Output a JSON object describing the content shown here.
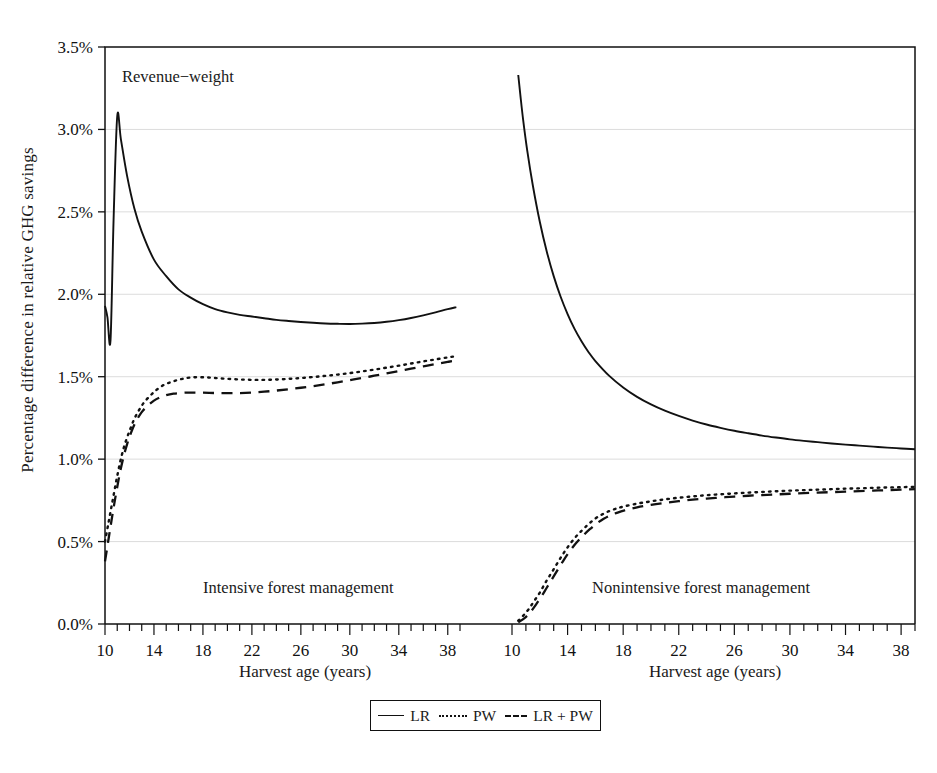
{
  "figure": {
    "ylabel": "Percentage difference in relative GHG savings",
    "annotation_top": "Revenue−weight",
    "panel_left_label": "Intensive forest management",
    "panel_right_label": "Nonintensive forest management",
    "xlabel_left": "Harvest age (years)",
    "xlabel_right": "Harvest age (years)",
    "line_color": "#111111",
    "grid_color": "#d8d8d8",
    "frame_color": "#111111"
  },
  "legend": {
    "position": "bottom-center",
    "items": [
      {
        "label": "LR",
        "style": "solid",
        "icon": "solid-line-swatch"
      },
      {
        "label": "PW",
        "style": "dotted",
        "icon": "dotted-line-swatch"
      },
      {
        "label": "LR + PW",
        "style": "dashed",
        "icon": "dashed-line-swatch"
      }
    ]
  },
  "chart_data": {
    "type": "line",
    "title": "Revenue−weight",
    "ylabel": "Percentage difference in relative GHG savings",
    "xlabel": "Harvest age (years)",
    "ylim": [
      0.0,
      3.5
    ],
    "yticks": [
      0.0,
      0.5,
      1.0,
      1.5,
      2.0,
      2.5,
      3.0,
      3.5
    ],
    "ytick_labels": [
      "0.0%",
      "0.5%",
      "1.0%",
      "1.5%",
      "2.0%",
      "2.5%",
      "3.0%",
      "3.5%"
    ],
    "grid": "horizontal",
    "xlim": [
      10,
      39
    ],
    "xticks": [
      10,
      11,
      12,
      13,
      14,
      15,
      16,
      17,
      18,
      19,
      20,
      21,
      22,
      23,
      24,
      25,
      26,
      27,
      28,
      29,
      30,
      31,
      32,
      33,
      34,
      35,
      36,
      37,
      38,
      39
    ],
    "xtick_labels": [
      10,
      14,
      18,
      22,
      26,
      30,
      34,
      38
    ],
    "panels": [
      {
        "name": "Intensive forest management",
        "series": [
          {
            "name": "LR",
            "style": "solid",
            "x": [
              10.0,
              10.2,
              10.45,
              10.7,
              11.0,
              11.3,
              11.8,
              12.4,
              13.0,
              14.0,
              15.0,
              16.0,
              17.0,
              18.0,
              19.0,
              20.0,
              21.0,
              22.0,
              23.0,
              24.0,
              25.0,
              26.0,
              27.0,
              28.0,
              29.0,
              30.0,
              31.0,
              32.0,
              33.0,
              34.0,
              35.0,
              36.0,
              37.0,
              38.0,
              38.7
            ],
            "y": [
              1.93,
              1.86,
              1.72,
              2.45,
              3.08,
              2.94,
              2.72,
              2.52,
              2.38,
              2.21,
              2.11,
              2.03,
              1.98,
              1.94,
              1.91,
              1.89,
              1.875,
              1.865,
              1.855,
              1.845,
              1.838,
              1.832,
              1.827,
              1.823,
              1.821,
              1.82,
              1.822,
              1.826,
              1.833,
              1.843,
              1.856,
              1.872,
              1.89,
              1.91,
              1.922
            ]
          },
          {
            "name": "PW",
            "style": "dotted",
            "x": [
              10.0,
              10.3,
              10.6,
              10.9,
              11.2,
              11.5,
              11.8,
              12.1,
              12.4,
              12.8,
              13.2,
              13.7,
              14.2,
              14.8,
              15.5,
              16.2,
              17.0,
              18.0,
              19.0,
              20.0,
              21.0,
              22.0,
              23.0,
              24.0,
              25.0,
              26.0,
              27.0,
              28.0,
              29.0,
              30.0,
              31.0,
              32.0,
              33.0,
              34.0,
              35.0,
              36.0,
              37.0,
              38.0,
              38.7
            ],
            "y": [
              0.5,
              0.62,
              0.74,
              0.86,
              0.97,
              1.06,
              1.13,
              1.19,
              1.245,
              1.3,
              1.345,
              1.385,
              1.42,
              1.45,
              1.47,
              1.485,
              1.495,
              1.497,
              1.492,
              1.487,
              1.483,
              1.481,
              1.481,
              1.483,
              1.487,
              1.492,
              1.498,
              1.505,
              1.513,
              1.522,
              1.532,
              1.543,
              1.555,
              1.567,
              1.58,
              1.593,
              1.605,
              1.617,
              1.625
            ]
          },
          {
            "name": "LR + PW",
            "style": "dashed",
            "x": [
              10.0,
              10.3,
              10.6,
              10.9,
              11.2,
              11.5,
              11.8,
              12.1,
              12.5,
              13.0,
              13.5,
              14.0,
              14.5,
              15.0,
              15.6,
              16.3,
              17.0,
              18.0,
              19.0,
              20.0,
              21.0,
              22.0,
              23.0,
              24.0,
              25.0,
              26.0,
              27.0,
              28.0,
              29.0,
              30.0,
              31.0,
              32.0,
              33.0,
              34.0,
              35.0,
              36.0,
              37.0,
              38.0,
              38.7
            ],
            "y": [
              0.38,
              0.52,
              0.66,
              0.79,
              0.91,
              1.01,
              1.09,
              1.155,
              1.225,
              1.285,
              1.325,
              1.355,
              1.375,
              1.388,
              1.397,
              1.402,
              1.404,
              1.403,
              1.401,
              1.4,
              1.401,
              1.404,
              1.409,
              1.416,
              1.424,
              1.433,
              1.443,
              1.454,
              1.466,
              1.479,
              1.492,
              1.506,
              1.52,
              1.534,
              1.549,
              1.563,
              1.577,
              1.59,
              1.598
            ]
          }
        ]
      },
      {
        "name": "Nonintensive forest management",
        "series": [
          {
            "name": "LR",
            "style": "solid",
            "x": [
              10.45,
              10.6,
              10.8,
              11.1,
              11.5,
              12.0,
              12.5,
              13.0,
              13.5,
              14.0,
              14.5,
              15.0,
              15.5,
              16.0,
              17.0,
              18.0,
              19.0,
              20.0,
              21.0,
              22.0,
              23.0,
              24.0,
              25.0,
              26.0,
              27.0,
              28.0,
              29.0,
              30.0,
              31.0,
              32.0,
              33.0,
              34.0,
              35.0,
              36.0,
              37.0,
              38.0,
              39.0
            ],
            "y": [
              3.33,
              3.21,
              3.06,
              2.87,
              2.66,
              2.44,
              2.26,
              2.11,
              1.985,
              1.88,
              1.79,
              1.715,
              1.65,
              1.595,
              1.505,
              1.435,
              1.378,
              1.332,
              1.294,
              1.262,
              1.234,
              1.21,
              1.19,
              1.172,
              1.157,
              1.143,
              1.131,
              1.12,
              1.111,
              1.103,
              1.095,
              1.088,
              1.082,
              1.076,
              1.07,
              1.065,
              1.06
            ]
          },
          {
            "name": "PW",
            "style": "dotted",
            "x": [
              10.45,
              10.8,
              11.2,
              11.6,
              12.0,
              12.4,
              12.8,
              13.2,
              13.6,
              14.0,
              14.5,
              15.0,
              15.5,
              16.0,
              16.5,
              17.0,
              17.5,
              18.0,
              19.0,
              20.0,
              21.0,
              22.0,
              23.0,
              24.0,
              25.0,
              26.0,
              27.0,
              28.0,
              29.0,
              30.0,
              31.0,
              32.0,
              33.0,
              34.0,
              35.0,
              36.0,
              37.0,
              38.0,
              39.0
            ],
            "y": [
              0.02,
              0.05,
              0.09,
              0.14,
              0.19,
              0.25,
              0.305,
              0.36,
              0.415,
              0.465,
              0.52,
              0.565,
              0.605,
              0.64,
              0.665,
              0.685,
              0.7,
              0.712,
              0.73,
              0.744,
              0.756,
              0.766,
              0.774,
              0.781,
              0.787,
              0.792,
              0.797,
              0.801,
              0.805,
              0.809,
              0.812,
              0.815,
              0.818,
              0.821,
              0.823,
              0.826,
              0.828,
              0.83,
              0.832
            ]
          },
          {
            "name": "LR + PW",
            "style": "dashed",
            "x": [
              10.45,
              10.9,
              11.3,
              11.7,
              12.1,
              12.5,
              12.9,
              13.3,
              13.7,
              14.1,
              14.6,
              15.1,
              15.6,
              16.1,
              16.6,
              17.1,
              17.6,
              18.1,
              19.0,
              20.0,
              21.0,
              22.0,
              23.0,
              24.0,
              25.0,
              26.0,
              27.0,
              28.0,
              29.0,
              30.0,
              31.0,
              32.0,
              33.0,
              34.0,
              35.0,
              36.0,
              37.0,
              38.0,
              39.0
            ],
            "y": [
              0.01,
              0.035,
              0.07,
              0.115,
              0.165,
              0.22,
              0.275,
              0.33,
              0.385,
              0.435,
              0.49,
              0.535,
              0.575,
              0.61,
              0.638,
              0.66,
              0.676,
              0.689,
              0.708,
              0.723,
              0.735,
              0.745,
              0.754,
              0.761,
              0.767,
              0.773,
              0.778,
              0.782,
              0.786,
              0.79,
              0.794,
              0.797,
              0.8,
              0.803,
              0.806,
              0.809,
              0.812,
              0.815,
              0.818
            ]
          }
        ]
      }
    ]
  }
}
